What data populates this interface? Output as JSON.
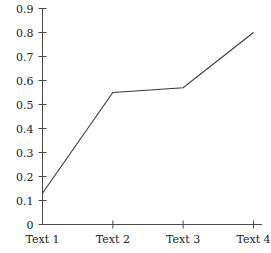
{
  "chart_data": {
    "type": "line",
    "title": "",
    "xlabel": "",
    "ylabel": "",
    "categories": [
      "Text 1",
      "Text 2",
      "Text 3",
      "Text 4"
    ],
    "values": [
      0.13,
      0.55,
      0.57,
      0.8
    ],
    "series": [
      {
        "name": "series-1",
        "values": [
          0.13,
          0.55,
          0.57,
          0.8
        ],
        "color": "#3a3a3a"
      }
    ],
    "ylim": [
      0,
      0.9
    ],
    "yticks": [
      0,
      0.1,
      0.2,
      0.3,
      0.4,
      0.5,
      0.6,
      0.7,
      0.8,
      0.9
    ],
    "ytick_labels": [
      "0",
      "0.1",
      "0.2",
      "0.3",
      "0.4",
      "0.5",
      "0.6",
      "0.7",
      "0.8",
      "0.9"
    ],
    "xtick_labels": [
      "Text 1",
      "Text 2",
      "Text 3",
      "Text 4"
    ],
    "grid": false,
    "legend": false,
    "markers": false,
    "axis_color": "#4a4a4a",
    "line_color": "#3a3a3a",
    "background": "#ffffff"
  }
}
